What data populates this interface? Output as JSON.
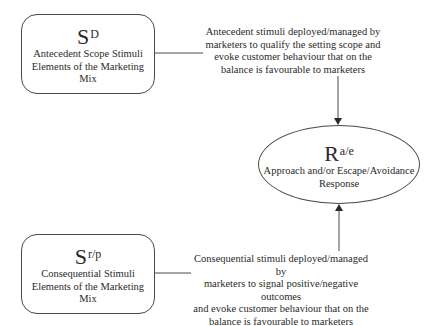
{
  "diagram": {
    "nodes": {
      "antecedent_box": {
        "symbol": "S",
        "superscript": "D",
        "line1": "Antecedent Scope Stimuli",
        "line2": "Elements of the Marketing Mix"
      },
      "consequential_box": {
        "symbol": "S",
        "superscript": "r/p",
        "line1": "Consequential Stimuli",
        "line2": "Elements of the Marketing Mix"
      },
      "response_ellipse": {
        "symbol": "R",
        "superscript": "a/e",
        "line1": "Approach and/or Escape/Avoidance",
        "line2": "Response"
      }
    },
    "annotations": {
      "antecedent_note": [
        "Antecedent stimuli deployed/managed by",
        "marketers to qualify the setting scope and",
        "evoke customer behaviour that on the",
        "balance is favourable to marketers"
      ],
      "consequential_note": [
        "Consequential stimuli deployed/managed by",
        "marketers to signal positive/negative outcomes",
        "and evoke customer behaviour that on the",
        "balance is favourable to marketers"
      ]
    },
    "edges": [
      {
        "from": "antecedent_box",
        "to": "response_ellipse",
        "direction": "down"
      },
      {
        "from": "consequential_box",
        "to": "response_ellipse",
        "direction": "up"
      }
    ],
    "colors": {
      "stroke": "#4a4a4a",
      "text": "#2a2a2a",
      "background": "#ffffff"
    }
  }
}
